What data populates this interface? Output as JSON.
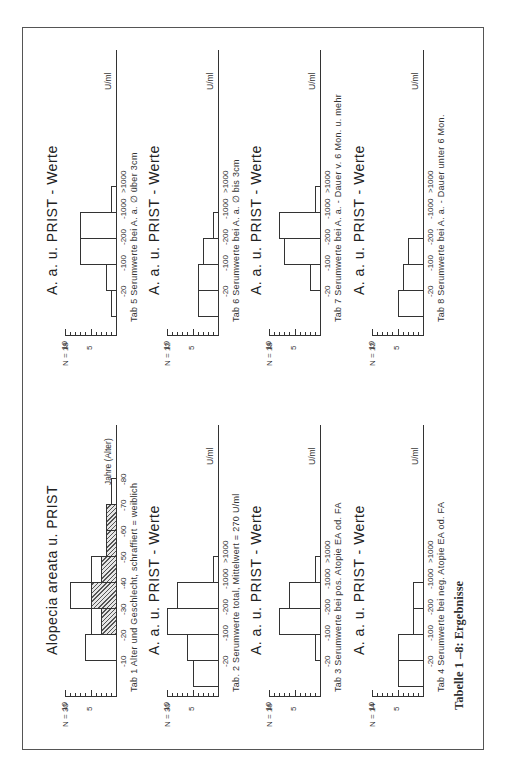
{
  "figure_caption": "Tabelle 1 –8: Ergebnisse",
  "chart_data": [
    {
      "id": "tab1",
      "type": "bar",
      "title": "Alopecia areata u. PRIST",
      "caption": "Tab 1  Alter und Geschlecht,  schraffiert = weiblich",
      "n_label": "N = 30",
      "xlabel": "Jahre (Alter)",
      "ylabel": "",
      "yticks": [
        "5",
        "10"
      ],
      "ylim": [
        0,
        10
      ],
      "categories": [
        "-10",
        "-20",
        "-30",
        "-40",
        "-50",
        "-60",
        "-70",
        "-80"
      ],
      "series": [
        {
          "name": "total",
          "values": [
            0,
            6,
            5,
            9,
            5,
            2,
            2,
            1
          ]
        },
        {
          "name": "weiblich (schraffiert)",
          "values": [
            0,
            0,
            3,
            5,
            3,
            2,
            2,
            0
          ]
        }
      ]
    },
    {
      "id": "tab2",
      "type": "bar",
      "title": "A. a. u. PRIST - Werte",
      "caption": "Tab. 2  Serumwerte total,  Mittelwert  = 270  U/ml",
      "n_label": "N = 30",
      "xlabel": "U/ml",
      "yticks": [
        "5",
        "10"
      ],
      "ylim": [
        0,
        10
      ],
      "categories": [
        "-20",
        "-100",
        "-200",
        "-1000",
        ">1000"
      ],
      "values": [
        5,
        6,
        10,
        8,
        1
      ]
    },
    {
      "id": "tab3",
      "type": "bar",
      "title": "A. a. u. PRIST - Werte",
      "caption": "Tab 3  Serumwerte bei pos. Atopie  EA  od. FA",
      "n_label": "N = 16",
      "xlabel": "U/ml",
      "yticks": [
        "5",
        "10"
      ],
      "ylim": [
        0,
        10
      ],
      "categories": [
        "-20",
        "-100",
        "-200",
        "-1000",
        ">1000"
      ],
      "values": [
        0,
        1,
        8,
        6,
        1
      ]
    },
    {
      "id": "tab4",
      "type": "bar",
      "title": "A. a. u. PRIST - Werte",
      "caption": "Tab 4  Serumwerte bei neg. Atopie  EA  od.  FA",
      "n_label": "N = 14",
      "xlabel": "U/ml",
      "yticks": [
        "5",
        "10"
      ],
      "ylim": [
        0,
        10
      ],
      "categories": [
        "-20",
        "-100",
        "-200",
        "-1000",
        ">1000"
      ],
      "values": [
        5,
        5,
        2,
        2,
        0
      ]
    },
    {
      "id": "tab5",
      "type": "bar",
      "title": "A. a. u. PRIST - Werte",
      "caption": "Tab 5  Serumwerte  bei  A. a. ∅ über  3cm",
      "n_label": "N = 18",
      "xlabel": "U/ml",
      "yticks": [
        "5",
        "10"
      ],
      "ylim": [
        0,
        10
      ],
      "categories": [
        "-20",
        "-100",
        "-200",
        "-1000",
        ">1000"
      ],
      "values": [
        1,
        2,
        7,
        7,
        1
      ]
    },
    {
      "id": "tab6",
      "type": "bar",
      "title": "A. a. u. PRIST - Werte",
      "caption": "Tab 6  Serumwerte  bei A. a.  ∅  bis  3cm",
      "n_label": "N = 12",
      "xlabel": "U/ml",
      "yticks": [
        "5",
        "10"
      ],
      "ylim": [
        0,
        10
      ],
      "categories": [
        "-20",
        "-100",
        "-200",
        "-1000",
        ">1000"
      ],
      "values": [
        4,
        4,
        3,
        1,
        0
      ]
    },
    {
      "id": "tab7",
      "type": "bar",
      "title": "A. a. u. PRIST - Werte",
      "caption": "Tab 7  Serumwerte  bei  A. a. - Dauer  v.  6 Mon.  u.  mehr",
      "n_label": "N = 18",
      "xlabel": "U/ml",
      "yticks": [
        "5",
        "10"
      ],
      "ylim": [
        0,
        10
      ],
      "categories": [
        "-20",
        "-100",
        "-200",
        "-1000",
        ">1000"
      ],
      "values": [
        0,
        2,
        7,
        8,
        1
      ]
    },
    {
      "id": "tab8",
      "type": "bar",
      "title": "A. a. u. PRIST - Werte",
      "caption": "Tab 8  Serumwerte  bei  A. a. - Dauer  unter  6 Mon.",
      "n_label": "N = 12",
      "xlabel": "U/ml",
      "yticks": [
        "5",
        "10"
      ],
      "ylim": [
        0,
        10
      ],
      "categories": [
        "-20",
        "-100",
        "-200",
        "-1000",
        ">1000"
      ],
      "values": [
        5,
        4,
        3,
        0,
        0
      ]
    }
  ]
}
